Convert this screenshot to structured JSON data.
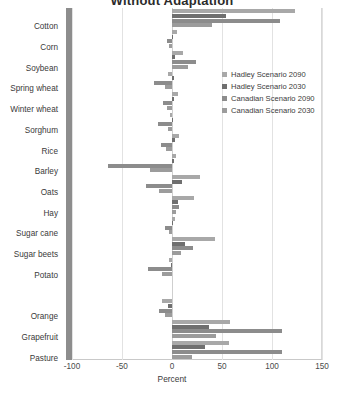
{
  "chart_data": {
    "type": "bar",
    "orientation": "horizontal",
    "title": "Without Adaptation",
    "xlabel": "Percent",
    "ylabel": "",
    "xlim": [
      -100,
      150
    ],
    "xticks": [
      -100,
      -50,
      0,
      50,
      100,
      150
    ],
    "grid": true,
    "legend_position": "upper-right-inside",
    "categories": [
      "Cotton",
      "Corn",
      "Soybean",
      "Spring wheat",
      "Winter wheat",
      "Sorghum",
      "Rice",
      "Barley",
      "Oats",
      "Hay",
      "Sugar cane",
      "Sugar beets",
      "Potato",
      "",
      "Orange",
      "Grapefruit",
      "Pasture"
    ],
    "series": [
      {
        "name": "Hadley Scenario 2090",
        "color": "#a8a8a8",
        "values": [
          123,
          5,
          11,
          -4,
          6,
          -2,
          7,
          4,
          28,
          22,
          3,
          43,
          -3,
          null,
          -10,
          58,
          57
        ]
      },
      {
        "name": "Hadley Scenario 2030",
        "color": "#6f6f6f",
        "values": [
          54,
          1,
          3,
          2,
          2,
          0,
          3,
          2,
          10,
          6,
          1,
          13,
          -1,
          null,
          -4,
          37,
          33
        ]
      },
      {
        "name": "Canadian Scenario 2090",
        "color": "#8c8c8c",
        "values": [
          108,
          -5,
          24,
          -18,
          -9,
          -14,
          -11,
          -64,
          -26,
          7,
          -7,
          21,
          -24,
          null,
          -13,
          110,
          110
        ]
      },
      {
        "name": "Canadian Scenario 2030",
        "color": "#9c9c9c",
        "values": [
          40,
          -3,
          16,
          -7,
          -5,
          -4,
          -6,
          -22,
          -13,
          4,
          -3,
          9,
          -10,
          null,
          -7,
          44,
          20
        ]
      }
    ]
  },
  "legend": {
    "items": [
      {
        "label": "Hadley Scenario 2090"
      },
      {
        "label": "Hadley Scenario 2030"
      },
      {
        "label": "Canadian Scenario 2090"
      },
      {
        "label": "Canadian Scenario 2030"
      }
    ]
  },
  "colors": {
    "background": "#ffffff",
    "category_axis_band": "#8d8d8d",
    "gridline": "#e2e2e2",
    "text": "#3a3a3a"
  }
}
